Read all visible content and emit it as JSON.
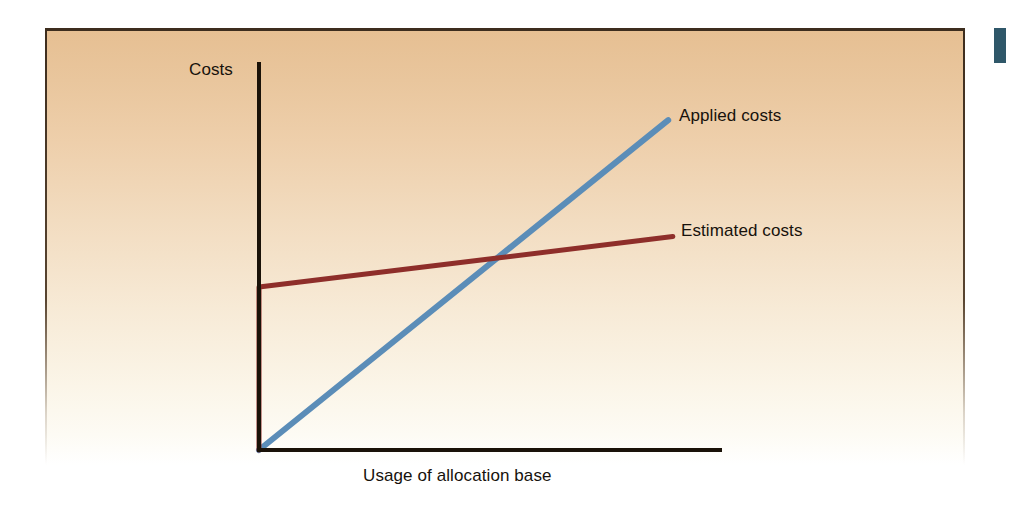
{
  "figure": {
    "panel_background_top_color": "#e6bf92",
    "panel_background_bottom_color": "#ffffff",
    "panel_border_color": "#3d2d1e",
    "axis_color": "#1a1208"
  },
  "artifact": {
    "name": "page-edge-mark",
    "color": "#1f4a5e"
  },
  "chart_data": {
    "type": "line",
    "title": "",
    "subtitle": "",
    "xlabel": "Usage of allocation base",
    "ylabel": "Costs",
    "xlim": [
      0,
      100
    ],
    "ylim": [
      0,
      100
    ],
    "grid": false,
    "axis_ticks": false,
    "legend": "inline-end-of-line",
    "series": [
      {
        "name": "Applied costs",
        "color": "#5b8db8",
        "label_position": "right-end",
        "description": "Straight proportional line rising from the origin",
        "points": [
          {
            "x": 0,
            "y": 0
          },
          {
            "x": 88,
            "y": 85
          }
        ]
      },
      {
        "name": "Estimated costs",
        "color": "#8e2e2a",
        "label_position": "right-end",
        "description": "Fixed cost step at zero usage, then a shallow upward slope",
        "points": [
          {
            "x": 0,
            "y": 0
          },
          {
            "x": 0,
            "y": 42
          },
          {
            "x": 89,
            "y": 55
          }
        ]
      }
    ],
    "annotations": [
      {
        "name": "crossover-point",
        "text": "",
        "x": 52,
        "y": 49,
        "description": "Applied costs line crosses the estimated costs line"
      }
    ]
  }
}
